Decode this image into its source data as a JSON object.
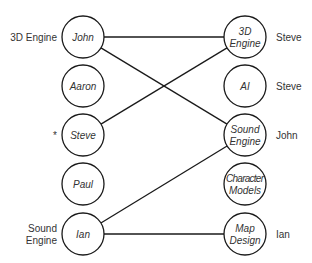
{
  "diagram": {
    "type": "bipartite-matching",
    "left_nodes": [
      {
        "id": "john",
        "label": "John",
        "cx": 83,
        "cy": 37,
        "side_label": [
          "3D Engine"
        ]
      },
      {
        "id": "aaron",
        "label": "Aaron",
        "cx": 83,
        "cy": 86,
        "side_label": []
      },
      {
        "id": "steve",
        "label": "Steve",
        "cx": 83,
        "cy": 135,
        "side_label": [
          "*"
        ]
      },
      {
        "id": "paul",
        "label": "Paul",
        "cx": 83,
        "cy": 184,
        "side_label": []
      },
      {
        "id": "ian",
        "label": "Ian",
        "cx": 83,
        "cy": 234,
        "side_label": [
          "Sound",
          "Engine"
        ]
      }
    ],
    "right_nodes": [
      {
        "id": "3d-engine",
        "label": [
          "3D",
          "Engine"
        ],
        "cx": 245,
        "cy": 37,
        "side_label": "Steve"
      },
      {
        "id": "ai",
        "label": [
          "AI"
        ],
        "cx": 245,
        "cy": 86,
        "side_label": "Steve"
      },
      {
        "id": "sound-engine",
        "label": [
          "Sound",
          "Engine"
        ],
        "cx": 245,
        "cy": 135,
        "side_label": "John"
      },
      {
        "id": "character-models",
        "label": [
          "Character",
          "Models"
        ],
        "cx": 245,
        "cy": 184,
        "side_label": ""
      },
      {
        "id": "map-design",
        "label": [
          "Map",
          "Design"
        ],
        "cx": 245,
        "cy": 234,
        "side_label": "Ian"
      }
    ],
    "edges": [
      {
        "from": "john",
        "to": "3d-engine"
      },
      {
        "from": "john",
        "to": "sound-engine"
      },
      {
        "from": "steve",
        "to": "3d-engine"
      },
      {
        "from": "ian",
        "to": "sound-engine"
      },
      {
        "from": "ian",
        "to": "map-design"
      }
    ],
    "radius": 21,
    "colors": {
      "stroke": "#1a1a1a",
      "text": "#333333",
      "background": "#ffffff"
    }
  }
}
